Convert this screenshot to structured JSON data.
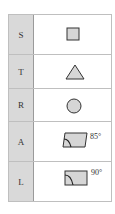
{
  "rows": [
    {
      "label": "S",
      "shape": "square-icon"
    },
    {
      "label": "T",
      "shape": "triangle-icon"
    },
    {
      "label": "R",
      "shape": "circle-icon"
    },
    {
      "label": "A",
      "shape": "parallelogram-angle-icon",
      "angle_text": "85°"
    },
    {
      "label": "L",
      "shape": "rectangle-right-angle-icon",
      "angle_text": "90°"
    }
  ],
  "colors": {
    "fill": "#d6d6d6",
    "stroke": "#333333",
    "label_bg": "#d9d9d9"
  }
}
